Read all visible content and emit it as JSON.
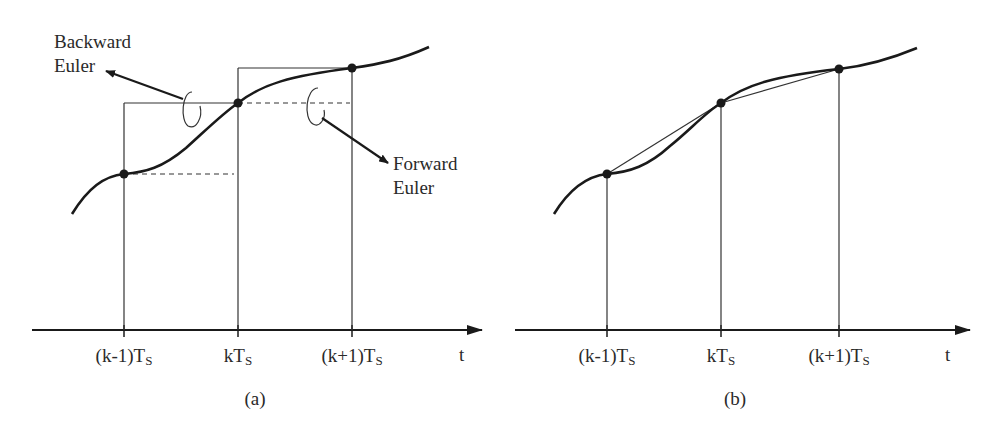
{
  "figure": {
    "panels": [
      {
        "id": "a",
        "caption": "(a)",
        "axis_label": "t",
        "ticks": [
          {
            "main": "(k-1)T",
            "sub": "S"
          },
          {
            "main": "kT",
            "sub": "S"
          },
          {
            "main": "(k+1)T",
            "sub": "S"
          }
        ],
        "annotations": {
          "backward": [
            "Backward",
            "Euler"
          ],
          "forward": [
            "Forward",
            "Euler"
          ]
        }
      },
      {
        "id": "b",
        "caption": "(b)",
        "axis_label": "t",
        "ticks": [
          {
            "main": "(k-1)T",
            "sub": "S"
          },
          {
            "main": "kT",
            "sub": "S"
          },
          {
            "main": "(k+1)T",
            "sub": "S"
          }
        ]
      }
    ],
    "colors": {
      "line": "#1a1a1a",
      "thin": "#333333",
      "background": "#ffffff"
    }
  }
}
